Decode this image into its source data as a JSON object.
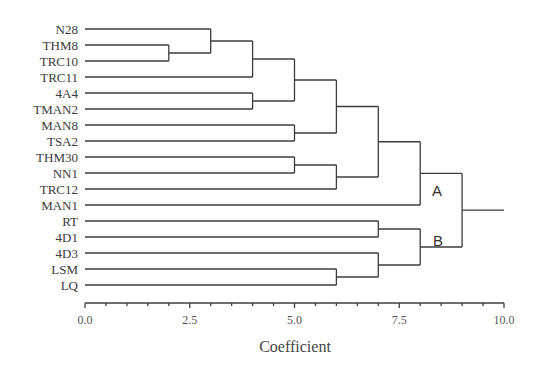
{
  "chart_data": {
    "type": "dendrogram",
    "title": "",
    "xlabel": "Coefficient",
    "ylabel": "",
    "xlim": [
      0.0,
      10.0
    ],
    "x_ticks": [
      "0.0",
      "2.5",
      "5.0",
      "7.5",
      "10.0"
    ],
    "leaves": [
      "N28",
      "THM8",
      "TRC10",
      "TRC11",
      "4A4",
      "TMAN2",
      "MAN8",
      "TSA2",
      "THM30",
      "NN1",
      "TRC12",
      "MAN1",
      "RT",
      "4D1",
      "4D3",
      "LSM",
      "LQ"
    ],
    "merges": [
      {
        "members": [
          "THM8",
          "TRC10"
        ],
        "height": 2.0
      },
      {
        "members": [
          "N28",
          "THM8+TRC10"
        ],
        "height": 3.0
      },
      {
        "members": [
          "N28 group",
          "TRC11"
        ],
        "height": 4.0
      },
      {
        "members": [
          "4A4",
          "TMAN2"
        ],
        "height": 4.0
      },
      {
        "members": [
          "N28..TRC11",
          "4A4+TMAN2"
        ],
        "height": 5.0
      },
      {
        "members": [
          "MAN8",
          "TSA2"
        ],
        "height": 5.0
      },
      {
        "members": [
          "N28..TMAN2",
          "MAN8+TSA2"
        ],
        "height": 6.0
      },
      {
        "members": [
          "THM30",
          "NN1"
        ],
        "height": 5.0
      },
      {
        "members": [
          "THM30+NN1",
          "TRC12"
        ],
        "height": 6.0
      },
      {
        "members": [
          "N28..TSA2",
          "THM30..TRC12"
        ],
        "height": 7.0
      },
      {
        "members": [
          "N28..TRC12",
          "MAN1"
        ],
        "height": 8.0,
        "cluster": "A"
      },
      {
        "members": [
          "RT",
          "4D1"
        ],
        "height": 7.0
      },
      {
        "members": [
          "LSM",
          "LQ"
        ],
        "height": 6.0
      },
      {
        "members": [
          "4D3",
          "LSM+LQ"
        ],
        "height": 7.0
      },
      {
        "members": [
          "RT+4D1",
          "4D3..LQ"
        ],
        "height": 8.0,
        "cluster": "B"
      },
      {
        "members": [
          "A",
          "B"
        ],
        "height": 9.0
      }
    ],
    "annotations": [
      "A",
      "B"
    ],
    "grid": false,
    "legend": null
  },
  "labels": {
    "cluster_a": "A",
    "cluster_b": "B",
    "axis_title": "Coefficient"
  }
}
